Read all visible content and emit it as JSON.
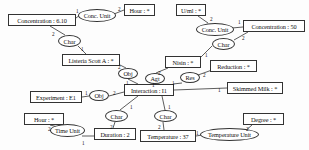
{
  "diagram": {
    "type": "conceptual-graph",
    "canvas": {
      "width": 309,
      "height": 150
    },
    "colors": {
      "stroke": "#333333",
      "background": "#fdfdfd",
      "text": "#111111"
    },
    "concepts": [
      {
        "id": "concentration_610",
        "label": "Concentration : 6.10",
        "x": 8,
        "y": 14,
        "w": 68,
        "h": 12
      },
      {
        "id": "hour_top",
        "label": "Hour : *",
        "x": 124,
        "y": 4,
        "w": 31,
        "h": 12
      },
      {
        "id": "uml",
        "label": "U/ml : *",
        "x": 176,
        "y": 4,
        "w": 30,
        "h": 12
      },
      {
        "id": "concentration_50",
        "label": "Concentration : 50",
        "x": 243,
        "y": 20,
        "w": 62,
        "h": 12
      },
      {
        "id": "listeria",
        "label": "Listeria Scott A : *",
        "x": 62,
        "y": 54,
        "w": 58,
        "h": 12
      },
      {
        "id": "nisin",
        "label": "Nisin : *",
        "x": 165,
        "y": 56,
        "w": 36,
        "h": 12
      },
      {
        "id": "reduction",
        "label": "Reduction : *",
        "x": 210,
        "y": 60,
        "w": 47,
        "h": 12
      },
      {
        "id": "experiment",
        "label": "Experiment : E1",
        "x": 30,
        "y": 91,
        "w": 52,
        "h": 12
      },
      {
        "id": "interaction",
        "label": "Interaction : I1",
        "x": 124,
        "y": 84,
        "w": 50,
        "h": 12
      },
      {
        "id": "skimmed_milk",
        "label": "Skimmed Milk : *",
        "x": 227,
        "y": 82,
        "w": 56,
        "h": 12
      },
      {
        "id": "hour_bottom",
        "label": "Hour : *",
        "x": 24,
        "y": 113,
        "w": 40,
        "h": 12
      },
      {
        "id": "duration",
        "label": "Duration : 2",
        "x": 94,
        "y": 128,
        "w": 42,
        "h": 12
      },
      {
        "id": "degree",
        "label": "Degree : *",
        "x": 243,
        "y": 113,
        "w": 41,
        "h": 12
      },
      {
        "id": "temperature",
        "label": "Temperature : 37",
        "x": 140,
        "y": 130,
        "w": 56,
        "h": 12
      }
    ],
    "relations": [
      {
        "id": "conc_unit_left",
        "label": "Conc. Unit",
        "x": 78,
        "y": 9,
        "w": 38,
        "h": 13
      },
      {
        "id": "conc_unit_right",
        "label": "Conc. Unit",
        "x": 196,
        "y": 23,
        "w": 38,
        "h": 13
      },
      {
        "id": "char_top_left",
        "label": "Char",
        "x": 58,
        "y": 35,
        "w": 23,
        "h": 12
      },
      {
        "id": "char_top_right",
        "label": "Char",
        "x": 212,
        "y": 38,
        "w": 23,
        "h": 12
      },
      {
        "id": "obj_listeria",
        "label": "Obj",
        "x": 118,
        "y": 68,
        "w": 20,
        "h": 11
      },
      {
        "id": "agt",
        "label": "Agt",
        "x": 145,
        "y": 73,
        "w": 20,
        "h": 11
      },
      {
        "id": "res",
        "label": "Res",
        "x": 180,
        "y": 72,
        "w": 20,
        "h": 11
      },
      {
        "id": "obj_experiment",
        "label": "Obj",
        "x": 89,
        "y": 90,
        "w": 20,
        "h": 11
      },
      {
        "id": "char_mid",
        "label": "Char",
        "x": 105,
        "y": 110,
        "w": 23,
        "h": 12
      },
      {
        "id": "char_right",
        "label": "Char",
        "x": 154,
        "y": 110,
        "w": 23,
        "h": 12
      },
      {
        "id": "time_unit",
        "label": "Time Unit",
        "x": 50,
        "y": 124,
        "w": 35,
        "h": 13
      },
      {
        "id": "temperature_unit",
        "label": "Temperature Unit",
        "x": 200,
        "y": 128,
        "w": 59,
        "h": 13
      }
    ],
    "edges": [
      {
        "from": "concentration_610",
        "to": "conc_unit_left",
        "label": "1",
        "lx": 76,
        "ly": 8,
        "x1": 76,
        "y1": 18,
        "x2": 80,
        "y2": 15
      },
      {
        "from": "conc_unit_left",
        "to": "hour_top",
        "label": "2",
        "lx": 118,
        "ly": 6,
        "x1": 114,
        "y1": 14,
        "x2": 124,
        "y2": 10
      },
      {
        "from": "uml",
        "to": "conc_unit_right",
        "label": "2",
        "lx": 210,
        "ly": 16,
        "x1": 198,
        "y1": 16,
        "x2": 208,
        "y2": 23
      },
      {
        "from": "conc_unit_right",
        "to": "concentration_50",
        "label": "1",
        "lx": 238,
        "ly": 19,
        "x1": 232,
        "y1": 28,
        "x2": 243,
        "y2": 27
      },
      {
        "from": "concentration_610",
        "to": "char_top_left",
        "label": "2",
        "lx": 52,
        "ly": 31,
        "x1": 50,
        "y1": 26,
        "x2": 65,
        "y2": 35
      },
      {
        "from": "char_top_left",
        "to": "listeria",
        "label": "1",
        "lx": 81,
        "ly": 46,
        "x1": 78,
        "y1": 46,
        "x2": 86,
        "y2": 54
      },
      {
        "from": "concentration_50",
        "to": "char_top_right",
        "label": "2",
        "lx": 242,
        "ly": 35,
        "x1": 248,
        "y1": 32,
        "x2": 234,
        "y2": 40
      },
      {
        "from": "char_top_right",
        "to": "nisin",
        "label": "1",
        "lx": 205,
        "ly": 52,
        "x1": 212,
        "y1": 46,
        "x2": 200,
        "y2": 58
      },
      {
        "from": "listeria",
        "to": "obj_listeria",
        "label": "2",
        "lx": 118,
        "ly": 64,
        "x1": 118,
        "y1": 64,
        "x2": 126,
        "y2": 68
      },
      {
        "from": "obj_listeria",
        "to": "interaction",
        "label": "1",
        "lx": 126,
        "ly": 80,
        "x1": 128,
        "y1": 79,
        "x2": 138,
        "y2": 84
      },
      {
        "from": "nisin",
        "to": "agt",
        "label": "2",
        "lx": 158,
        "ly": 70,
        "x1": 168,
        "y1": 68,
        "x2": 156,
        "y2": 73
      },
      {
        "from": "agt",
        "to": "interaction",
        "label": "1",
        "lx": 152,
        "ly": 82,
        "x1": 153,
        "y1": 84,
        "x2": 155,
        "y2": 84
      },
      {
        "from": "reduction",
        "to": "res",
        "label": "2",
        "lx": 203,
        "ly": 72,
        "x1": 212,
        "y1": 70,
        "x2": 198,
        "y2": 75
      },
      {
        "from": "res",
        "to": "interaction",
        "label": "1",
        "lx": 172,
        "ly": 80,
        "x1": 182,
        "y1": 83,
        "x2": 173,
        "y2": 84
      },
      {
        "from": "experiment",
        "to": "obj_experiment",
        "label": "1",
        "lx": 85,
        "ly": 90,
        "x1": 82,
        "y1": 97,
        "x2": 89,
        "y2": 96
      },
      {
        "from": "obj_experiment",
        "to": "interaction",
        "label": "2",
        "lx": 113,
        "ly": 90,
        "x1": 109,
        "y1": 96,
        "x2": 124,
        "y2": 92
      },
      {
        "from": "interaction",
        "to": "skimmed_milk",
        "label": "1",
        "lx": 218,
        "ly": 87,
        "x1": 174,
        "y1": 90,
        "x2": 227,
        "y2": 88
      },
      {
        "from": "interaction",
        "to": "char_mid",
        "label": "1",
        "lx": 130,
        "ly": 104,
        "x1": 138,
        "y1": 96,
        "x2": 120,
        "y2": 110
      },
      {
        "from": "interaction",
        "to": "char_right",
        "label": "1",
        "lx": 168,
        "ly": 104,
        "x1": 162,
        "y1": 96,
        "x2": 165,
        "y2": 110
      },
      {
        "from": "char_mid",
        "to": "duration",
        "label": "2",
        "lx": 110,
        "ly": 124,
        "x1": 115,
        "y1": 122,
        "x2": 113,
        "y2": 128
      },
      {
        "from": "char_right",
        "to": "temperature",
        "label": "2",
        "lx": 158,
        "ly": 124,
        "x1": 163,
        "y1": 122,
        "x2": 164,
        "y2": 130
      },
      {
        "from": "hour_bottom",
        "to": "time_unit",
        "label": "2",
        "lx": 48,
        "ly": 126,
        "x1": 50,
        "y1": 125,
        "x2": 58,
        "y2": 127
      },
      {
        "from": "time_unit",
        "to": "duration",
        "label": "1",
        "lx": 82,
        "ly": 140,
        "x1": 82,
        "y1": 136,
        "x2": 94,
        "y2": 136
      },
      {
        "from": "temperature",
        "to": "temperature_unit",
        "label": "1",
        "lx": 196,
        "ly": 130,
        "x1": 196,
        "y1": 136,
        "x2": 202,
        "y2": 135
      },
      {
        "from": "degree",
        "to": "temperature_unit",
        "label": "2",
        "lx": 246,
        "ly": 126,
        "x1": 252,
        "y1": 125,
        "x2": 244,
        "y2": 132
      }
    ]
  }
}
